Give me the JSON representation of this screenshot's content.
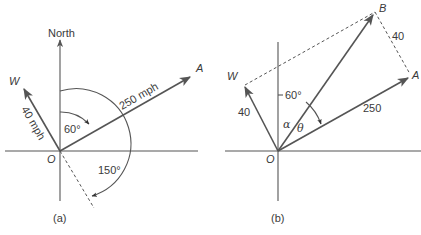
{
  "diagram_a": {
    "caption": "(a)",
    "axis_label": "North",
    "origin_label": "O",
    "vector_a_label": "A",
    "vector_a_speed": "250 mph",
    "vector_w_label": "W",
    "vector_w_speed": "40 mph",
    "angle_inner": "60°",
    "angle_outer": "150°"
  },
  "diagram_b": {
    "caption": "(b)",
    "origin_label": "O",
    "vector_a_label": "A",
    "vector_a_magnitude": "250",
    "vector_w_label": "W",
    "vector_w_magnitude": "40",
    "resultant_label": "B",
    "side_ab_magnitude": "40",
    "angle_label": "60°",
    "alpha_label": "α",
    "theta_label": "θ"
  },
  "colors": {
    "stroke": "#555555",
    "text": "#3a3a3a",
    "background": "#ffffff"
  }
}
